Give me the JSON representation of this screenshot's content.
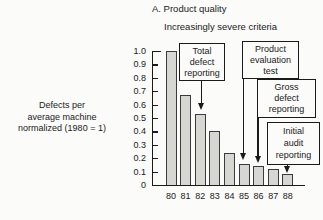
{
  "title": "A. Product quality",
  "subtitle": "Increasingly severe criteria",
  "y_axis_label": {
    "lines": [
      "Defects per",
      "average machine",
      "normalized (1980 = 1)"
    ]
  },
  "chart_data": {
    "type": "bar",
    "title": "A. Product quality",
    "subtitle": "Increasingly severe criteria",
    "categories": [
      "80",
      "81",
      "82",
      "83",
      "84",
      "85",
      "86",
      "87",
      "88"
    ],
    "values": [
      1.0,
      0.67,
      0.53,
      0.4,
      0.24,
      0.16,
      0.14,
      0.12,
      0.08
    ],
    "xlabel": "",
    "ylabel": "Defects per average machine normalized (1980 = 1)",
    "ylim": [
      0,
      1.0
    ],
    "ytick_labels": [
      "1.0",
      "0.9",
      "0.8",
      "0.7",
      "0.6",
      "0.5",
      "0.4",
      "0.3",
      "0.2",
      "0.1",
      "0"
    ],
    "grid": false,
    "legend": false,
    "bar_fill_color": "#d6d6d3",
    "bar_border_color": "#3b3b3b",
    "annotations": [
      {
        "label": "Total defect reporting",
        "target_category": "82"
      },
      {
        "label": "Product evaluation test",
        "target_category": "85"
      },
      {
        "label": "Gross defect reporting",
        "target_category": "86"
      },
      {
        "label": "Initial audit reporting",
        "target_category": "88"
      }
    ]
  },
  "annotation_boxes": {
    "total": {
      "lines": [
        "Total",
        "defect",
        "reporting"
      ]
    },
    "product": {
      "lines": [
        "Product",
        "evaluation",
        "test"
      ]
    },
    "gross": {
      "lines": [
        "Gross",
        "defect",
        "reporting"
      ]
    },
    "initial": {
      "lines": [
        "Initial",
        "audit",
        "reporting"
      ]
    }
  }
}
